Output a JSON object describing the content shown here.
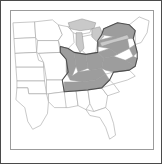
{
  "figure": {
    "kind": "distribution-range-map",
    "region_title": "Eastern United States",
    "frame_border_color": "#4a4a4a",
    "map_border_color": "#9b9b9b",
    "background_color": "#ffffff"
  },
  "legend": {
    "shaded_label": "Range",
    "unshaded_label": "Outside range",
    "shaded_color": "#9d9d9d",
    "unshaded_color": "#ffffff",
    "outline_color": "#4f4f4f",
    "lake_color": "#c9c9c9",
    "border_color": "#9a9a9a"
  },
  "map": {
    "view_width": 144,
    "view_height": 140,
    "states": [
      {
        "code": "ND",
        "name": "North Dakota",
        "shaded": false,
        "path": "M2,12 L24,11 L25,27 L3,28 Z"
      },
      {
        "code": "SD",
        "name": "South Dakota",
        "shaded": false,
        "path": "M3,28 L25,27 L26,42 L4,43 Z"
      },
      {
        "code": "NE",
        "name": "Nebraska",
        "shaded": false,
        "path": "M4,43 L26,42 L28,50 L33,52 L33,57 L5,57 Z"
      },
      {
        "code": "KS",
        "name": "Kansas",
        "shaded": false,
        "path": "M5,57 L33,57 L34,71 L6,71 Z"
      },
      {
        "code": "OK",
        "name": "Oklahoma",
        "shaded": false,
        "path": "M6,71 L34,71 L36,84 L18,84 L17,78 L6,78 Z"
      },
      {
        "code": "TX",
        "name": "Texas",
        "shaded": false,
        "path": "M6,78 L17,78 L18,84 L36,84 L38,92 L37,104 L30,116 L22,120 L17,112 L14,98 L5,90 Z"
      },
      {
        "code": "MN",
        "name": "Minnesota",
        "shaded": false,
        "path": "M24,11 L42,9 L48,14 L52,24 L48,30 L27,30 L25,27 Z"
      },
      {
        "code": "IA",
        "name": "Iowa",
        "shaded": false,
        "path": "M27,30 L48,30 L50,42 L28,43 L26,42 Z"
      },
      {
        "code": "MO",
        "name": "Missouri",
        "shaded": false,
        "path": "M28,43 L50,42 L56,49 L58,62 L52,70 L36,70 L34,57 L33,52 Z"
      },
      {
        "code": "AR",
        "name": "Arkansas",
        "shaded": false,
        "path": "M36,70 L52,70 L54,82 L38,84 L36,84 Z"
      },
      {
        "code": "LA",
        "name": "Louisiana",
        "shaded": false,
        "path": "M38,84 L54,82 L58,90 L56,98 L44,98 L38,92 Z"
      },
      {
        "code": "WI",
        "name": "Wisconsin",
        "shaded": false,
        "path": "M48,14 L58,16 L63,22 L64,32 L58,38 L50,36 L48,30 L52,24 Z"
      },
      {
        "code": "IL",
        "name": "Illinois",
        "shaded": true,
        "path": "M50,36 L58,38 L64,42 L66,56 L62,66 L56,62 L56,49 L50,42 Z"
      },
      {
        "code": "MI-UP",
        "name": "Michigan Upper Peninsula",
        "shaded": false,
        "path": "M58,16 L72,12 L82,16 L80,22 L68,24 L63,22 Z"
      },
      {
        "code": "MI-LP",
        "name": "Michigan Lower Peninsula",
        "shaded": false,
        "path": "M72,26 L82,24 L88,30 L86,42 L78,46 L72,40 Z"
      },
      {
        "code": "IN",
        "name": "Indiana",
        "shaded": true,
        "path": "M66,42 L76,44 L78,58 L68,62 L66,56 L64,42 Z"
      },
      {
        "code": "OH",
        "name": "Ohio",
        "shaded": true,
        "path": "M76,44 L88,42 L94,48 L92,58 L80,60 L78,58 Z"
      },
      {
        "code": "KY",
        "name": "Kentucky",
        "shaded": true,
        "path": "M56,62 L62,66 L68,62 L80,60 L92,58 L96,64 L86,70 L72,72 L60,70 Z"
      },
      {
        "code": "TN",
        "name": "Tennessee",
        "shaded": true,
        "path": "M54,72 L72,72 L86,70 L96,64 L100,70 L92,78 L72,80 L54,82 Z"
      },
      {
        "code": "MS",
        "name": "Mississippi",
        "shaded": false,
        "path": "M54,82 L66,81 L68,96 L58,98 L56,98 Z"
      },
      {
        "code": "AL",
        "name": "Alabama",
        "shaded": false,
        "path": "M66,81 L78,80 L80,94 L76,100 L68,96 Z"
      },
      {
        "code": "GA",
        "name": "Georgia",
        "shaded": false,
        "path": "M78,80 L92,78 L98,86 L96,98 L84,102 L80,94 Z"
      },
      {
        "code": "FL",
        "name": "Florida",
        "shaded": false,
        "path": "M76,100 L84,102 L96,98 L100,102 L104,114 L106,126 L100,130 L96,118 L90,108 L80,106 Z"
      },
      {
        "code": "SC",
        "name": "South Carolina",
        "shaded": false,
        "path": "M92,78 L104,74 L110,82 L98,86 Z"
      },
      {
        "code": "NC",
        "name": "North Carolina",
        "shaded": false,
        "path": "M96,64 L100,70 L104,74 L118,70 L126,66 L120,60 L104,62 Z"
      },
      {
        "code": "VA",
        "name": "Virginia",
        "shaded": true,
        "path": "M94,48 L104,46 L116,50 L126,56 L120,60 L104,62 L96,60 L92,58 Z"
      },
      {
        "code": "WV",
        "name": "West Virginia",
        "shaded": true,
        "path": "M88,42 L100,38 L108,44 L104,46 L94,48 Z"
      },
      {
        "code": "PA",
        "name": "Pennsylvania",
        "shaded": true,
        "path": "M88,30 L104,26 L118,28 L120,38 L108,44 L100,38 L88,36 Z"
      },
      {
        "code": "NY",
        "name": "New York",
        "shaded": true,
        "path": "M94,18 L108,12 L120,14 L126,20 L124,28 L118,28 L104,26 L92,24 Z"
      },
      {
        "code": "NJ",
        "name": "New Jersey",
        "shaded": true,
        "path": "M120,38 L126,34 L128,42 L124,46 Z"
      },
      {
        "code": "MD-DE",
        "name": "Maryland and Delaware",
        "shaded": true,
        "path": "M116,50 L124,46 L128,48 L126,56 Z"
      },
      {
        "code": "NEW-ENG",
        "name": "New England",
        "shaded": false,
        "path": "M120,14 L130,6 L140,10 L138,22 L132,32 L126,34 L126,20 Z"
      }
    ],
    "lakes": [
      {
        "name": "Lake Superior",
        "path": "M58,12 L72,8 L86,12 L84,18 L70,20 L60,18 Z"
      },
      {
        "name": "Lake Michigan",
        "path": "M66,22 L72,22 L74,38 L70,42 L66,34 Z"
      },
      {
        "name": "Lake Huron",
        "path": "M82,18 L90,16 L94,26 L88,32 L82,26 Z"
      },
      {
        "name": "Lake Erie and Lake Ontario",
        "path": "M90,32 L106,28 L118,24 L120,28 L104,32 L92,36 Z"
      }
    ],
    "range_outline_path": "M50,36 L58,38 L64,42 L76,44 L88,42 L88,36 L88,30 L92,24 L94,18 L108,12 L120,14 L126,20 L124,28 L126,34 L128,42 L128,48 L126,56 L120,60 L104,62 L100,70 L92,78 L78,80 L66,81 L54,82 L52,70 L58,62 L56,49 L50,42 Z"
  }
}
